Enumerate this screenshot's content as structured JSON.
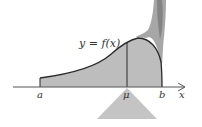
{
  "diagram": {
    "curve_label": "y = f(x)",
    "axis_labels": {
      "a": "a",
      "mu": "μ",
      "b": "b",
      "x": "x"
    },
    "colors": {
      "fill": "#bdbdbd",
      "curve": "#2a2a2a",
      "axis": "#555555",
      "fulcrum": "#c4c4c4",
      "hand": "#8a8a8a"
    }
  }
}
